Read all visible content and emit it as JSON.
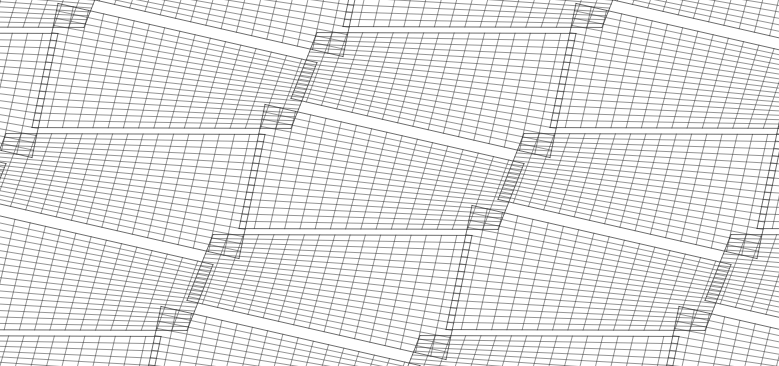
{
  "canvas": {
    "width": 779,
    "height": 366,
    "background_color": "#ffffff"
  },
  "style": {
    "line_color": "#2b2b2b",
    "line_width": 0.55,
    "edge_color": "#1a1a1a",
    "edge_width": 0.7,
    "line_opacity": 0.92
  },
  "chart_data": {
    "type": "line",
    "subtitle": "Doubly-ruled surface wireframe, sheared perspective lattice",
    "xlabel": "",
    "ylabel": "",
    "grid": false,
    "legend_position": "none",
    "xlim": [
      0,
      779
    ],
    "ylim": [
      0,
      366
    ],
    "surface_type": "hyperbolic-paraboloid",
    "rulings_per_family": 17,
    "ruling_families": 2,
    "lattice": {
      "columns": 4,
      "rows": 4,
      "cell_width": 259,
      "cell_height": 95,
      "column_shear_x": -26,
      "column_shear_y": 30,
      "row_shear_x": -52,
      "row_shear_y": 6,
      "origin_x": 58,
      "origin_y": 18
    },
    "corner_heights": [
      28,
      -28,
      28,
      -28
    ],
    "projection": {
      "type": "oblique-perspective",
      "foreshorten_x": 1.0,
      "foreshorten_y": 0.52,
      "vertical_scale": 1.0
    }
  }
}
